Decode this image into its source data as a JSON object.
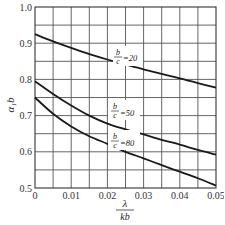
{
  "chart_data": {
    "type": "line",
    "title": "",
    "xlabel": "λ / kb",
    "xlabel_num": "λ",
    "xlabel_den": "kb",
    "ylabel": "α₁b",
    "xlim": [
      0,
      0.05
    ],
    "ylim": [
      0.5,
      1.0
    ],
    "grid": true,
    "x_ticks": [
      "0",
      "0.01",
      "0.02",
      "0.03",
      "0.04",
      "0.05"
    ],
    "y_ticks": [
      "0.5",
      "0.6",
      "0.7",
      "0.8",
      "0.9",
      "1.0"
    ],
    "x_minor_step": 0.005,
    "y_minor_step": 0.05,
    "x": [
      0,
      0.005,
      0.01,
      0.015,
      0.02,
      0.025,
      0.03,
      0.035,
      0.04,
      0.045,
      0.05
    ],
    "series": [
      {
        "name": "b/c = 20",
        "label_num": "b",
        "label_den": "c",
        "label_val": "=20",
        "values": [
          0.925,
          0.905,
          0.887,
          0.87,
          0.855,
          0.841,
          0.828,
          0.815,
          0.803,
          0.79,
          0.777
        ]
      },
      {
        "name": "b/c = 50",
        "label_num": "b",
        "label_den": "c",
        "label_val": "=50",
        "values": [
          0.795,
          0.76,
          0.728,
          0.7,
          0.678,
          0.662,
          0.648,
          0.633,
          0.62,
          0.605,
          0.592
        ]
      },
      {
        "name": "b/c = 80",
        "label_num": "b",
        "label_den": "c",
        "label_val": "=80",
        "values": [
          0.75,
          0.705,
          0.67,
          0.643,
          0.622,
          0.6,
          0.582,
          0.563,
          0.545,
          0.527,
          0.507
        ]
      }
    ]
  }
}
